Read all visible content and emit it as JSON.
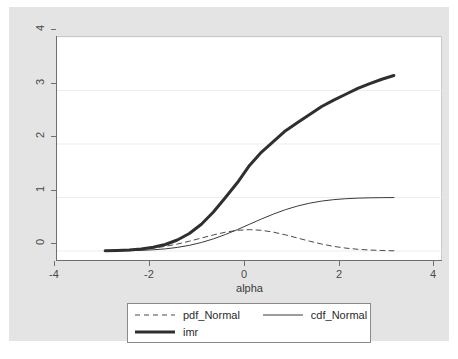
{
  "chart_data": {
    "type": "line",
    "title": "",
    "xlabel": "alpha",
    "ylabel": "",
    "xlim": [
      -4,
      4
    ],
    "ylim": [
      0,
      4
    ],
    "xticks": [
      -4,
      -2,
      0,
      2,
      4
    ],
    "yticks": [
      0,
      1,
      2,
      3,
      4
    ],
    "xtick_labels": [
      "-4",
      "-2",
      "0",
      "2",
      "4"
    ],
    "ytick_labels": [
      "0",
      "1",
      "2",
      "3",
      "4"
    ],
    "grid": "horizontal",
    "legend_position": "bottom",
    "x": [
      -3.0,
      -2.75,
      -2.5,
      -2.25,
      -2.0,
      -1.75,
      -1.5,
      -1.25,
      -1.0,
      -0.75,
      -0.5,
      -0.25,
      0.0,
      0.25,
      0.5,
      0.75,
      1.0,
      1.25,
      1.5,
      1.75,
      2.0,
      2.25,
      2.5,
      2.75,
      3.0
    ],
    "series": [
      {
        "name": "pdf_Normal",
        "style": "dashed",
        "width": 1,
        "color": "#4a4a4a",
        "values": [
          0.004,
          0.009,
          0.018,
          0.032,
          0.054,
          0.086,
          0.13,
          0.183,
          0.242,
          0.301,
          0.352,
          0.387,
          0.399,
          0.387,
          0.352,
          0.301,
          0.242,
          0.183,
          0.13,
          0.086,
          0.054,
          0.032,
          0.018,
          0.009,
          0.004
        ]
      },
      {
        "name": "cdf_Normal",
        "style": "solid",
        "width": 1,
        "color": "#3a3a3a",
        "values": [
          0.001,
          0.003,
          0.006,
          0.012,
          0.023,
          0.04,
          0.067,
          0.106,
          0.159,
          0.227,
          0.309,
          0.401,
          0.5,
          0.599,
          0.691,
          0.773,
          0.841,
          0.894,
          0.933,
          0.96,
          0.977,
          0.988,
          0.994,
          0.997,
          0.999
        ]
      },
      {
        "name": "imr",
        "style": "solid",
        "width": 3,
        "color": "#2f2f2f",
        "values": [
          0.0038,
          0.0086,
          0.0183,
          0.0364,
          0.0684,
          0.1213,
          0.2035,
          0.3244,
          0.4931,
          0.7167,
          1.0,
          1.3467,
          1.7725,
          2.2139,
          2.6587,
          3.1062,
          3.5554,
          4.0055,
          4.4563,
          4.9076,
          5.3593,
          5.8112,
          6.2633,
          6.7155,
          7.1678
        ],
        "plotted_values": [
          0.004,
          0.009,
          0.018,
          0.037,
          0.069,
          0.122,
          0.205,
          0.327,
          0.5,
          0.73,
          1.0,
          1.28,
          1.6,
          1.85,
          2.05,
          2.25,
          2.4,
          2.55,
          2.7,
          2.82,
          2.93,
          3.04,
          3.13,
          3.21,
          3.28
        ]
      }
    ]
  },
  "axis": {
    "x_title": "alpha"
  },
  "legend": {
    "entries": [
      {
        "label": "pdf_Normal",
        "style": "dashed"
      },
      {
        "label": "cdf_Normal",
        "style": "thin-solid"
      },
      {
        "label": "imr",
        "style": "thick-solid"
      }
    ]
  },
  "colors": {
    "graph_region": "#e4e4e4",
    "plot_background": "#ffffff",
    "axis": "#6e6e6e",
    "gridline": "#ededed",
    "text": "#3a3a3a"
  }
}
